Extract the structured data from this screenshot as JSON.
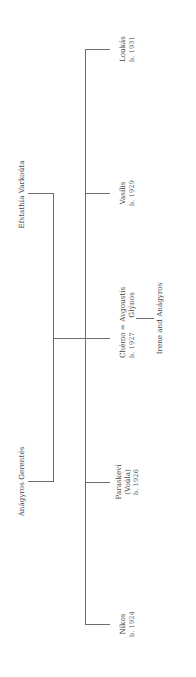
{
  "diagram": {
    "type": "family-tree",
    "orientation": "rotated-90-ccw",
    "parents": [
      {
        "id": "father",
        "name": "Anágyros Gerentés"
      },
      {
        "id": "mother",
        "name": "Efstathía Varkoúta"
      }
    ],
    "children": [
      {
        "id": "nikos",
        "name": "Níkos",
        "born": "b. 1924"
      },
      {
        "id": "paraskevi",
        "name": "Paraskeví",
        "nickname": "(Voúla)",
        "born": "b. 1926"
      },
      {
        "id": "chemo",
        "name": "Chémo",
        "marriage_symbol": "=",
        "spouse": "Avgoustís",
        "spouse_surname": "Glýnos",
        "born": "b. 1927",
        "descendants": "Irene and Anágyros"
      },
      {
        "id": "vasilis",
        "name": "Vasílis",
        "born": "b. 1929"
      },
      {
        "id": "loukas",
        "name": "Loukás",
        "born": "b. 1931"
      }
    ],
    "line_color": "#6e6e6e",
    "text_color": "#4a4a4a"
  }
}
